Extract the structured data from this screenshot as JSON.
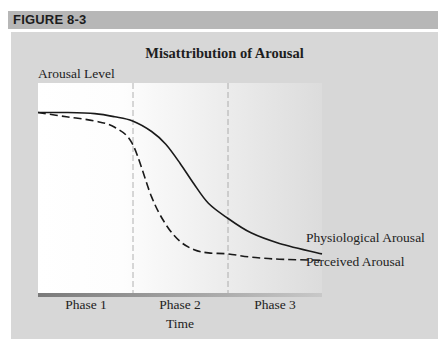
{
  "figure": {
    "label": "FIGURE 8-3"
  },
  "chart_data": {
    "type": "line",
    "title": "Misattribution of Arousal",
    "xlabel": "Time",
    "ylabel": "Arousal Level",
    "x_regions": [
      "Phase 1",
      "Phase 2",
      "Phase 3"
    ],
    "x_region_boundaries": [
      0.333,
      0.667
    ],
    "xlim": [
      0,
      1
    ],
    "ylim": [
      0,
      1
    ],
    "grid": false,
    "legend_position": "inline-right",
    "x": [
      0.0,
      0.1,
      0.2,
      0.27,
      0.333,
      0.4,
      0.45,
      0.5,
      0.55,
      0.6,
      0.667,
      0.75,
      0.85,
      1.0
    ],
    "series": [
      {
        "name": "Physiological Arousal",
        "style": "solid",
        "values": [
          0.86,
          0.86,
          0.855,
          0.84,
          0.82,
          0.77,
          0.71,
          0.62,
          0.52,
          0.43,
          0.36,
          0.29,
          0.24,
          0.19
        ]
      },
      {
        "name": "Perceived Arousal",
        "style": "dashed",
        "values": [
          0.86,
          0.84,
          0.82,
          0.79,
          0.71,
          0.46,
          0.33,
          0.25,
          0.21,
          0.195,
          0.19,
          0.175,
          0.165,
          0.16
        ]
      }
    ]
  },
  "colors": {
    "header_band": "#b7b7b7",
    "panel": "#d7d7d7",
    "plot_left": "#ffffff",
    "plot_right": "#dcdcdc",
    "line": "#1a1a1a",
    "phase_divider": "#9a9a9a"
  }
}
